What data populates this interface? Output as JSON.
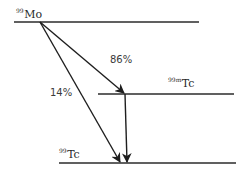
{
  "diagram": {
    "type": "decay-scheme",
    "levels": [
      {
        "id": "mo99",
        "mass": "99",
        "element": "Mo",
        "x1": 14,
        "x2": 199,
        "y": 22
      },
      {
        "id": "tc99m",
        "mass": "99m",
        "element": "Tc",
        "x1": 98,
        "x2": 234,
        "y": 94
      },
      {
        "id": "tc99",
        "mass": "99",
        "element": "Tc",
        "x1": 59,
        "x2": 236,
        "y": 163
      }
    ],
    "transitions": [
      {
        "id": "mo-to-tc99m",
        "from": "mo99",
        "to": "tc99m",
        "label": "86%",
        "x1": 40,
        "y1": 22,
        "x2": 124,
        "y2": 93
      },
      {
        "id": "mo-to-tc99",
        "from": "mo99",
        "to": "tc99",
        "label": "14%",
        "x1": 40,
        "y1": 22,
        "x2": 120,
        "y2": 162
      },
      {
        "id": "tc99m-to-tc99",
        "from": "tc99m",
        "to": "tc99",
        "label": "",
        "x1": 125,
        "y1": 94,
        "x2": 127,
        "y2": 162
      }
    ],
    "line_color": "#2b2b2b"
  }
}
